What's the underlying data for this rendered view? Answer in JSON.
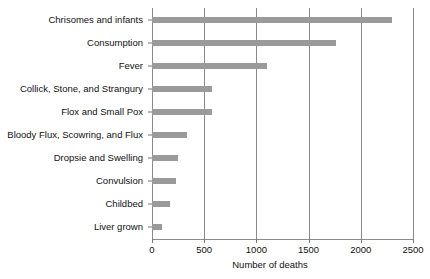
{
  "chart_data": {
    "type": "bar",
    "orientation": "horizontal",
    "title": "",
    "xlabel": "Number of deaths",
    "ylabel": "",
    "xlim": [
      0,
      2500
    ],
    "xticks": [
      0,
      500,
      1000,
      1500,
      2000,
      2500
    ],
    "xtick_labels": [
      "0",
      "500",
      "1000",
      "1500",
      "2000",
      "2500"
    ],
    "grid": "vertical",
    "legend": "none",
    "bar_color": "#9a9a9a",
    "categories": [
      "Chrisomes and infants",
      "Consumption",
      "Fever",
      "Collick, Stone, and Strangury",
      "Flox and Small Pox",
      "Bloody Flux, Scowring, and Flux",
      "Dropsie and Swelling",
      "Convulsion",
      "Childbed",
      "Liver grown"
    ],
    "values": [
      2300,
      1760,
      1100,
      575,
      570,
      340,
      250,
      230,
      170,
      100
    ]
  }
}
